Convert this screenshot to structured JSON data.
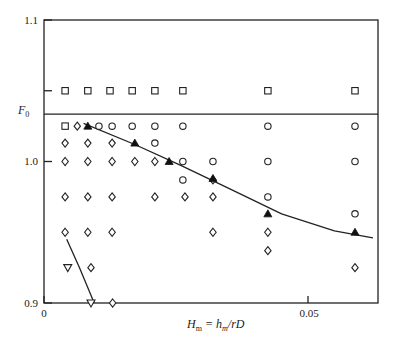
{
  "chart_data": {
    "type": "scatter",
    "title": "",
    "xlabel": "H_m = h_m/rD",
    "ylabel": "F_0",
    "xlim": [
      0,
      0.063
    ],
    "ylim": [
      0.9,
      1.1
    ],
    "x_ticks": [
      {
        "value": 0,
        "label": "0"
      },
      {
        "value": 0.05,
        "label": "0.05"
      }
    ],
    "y_ticks": [
      {
        "value": 0.9,
        "label": "0.9"
      },
      {
        "value": 1.0,
        "label": "1.0"
      },
      {
        "value": 1.1,
        "label": "1.1"
      },
      {
        "value": 1.05,
        "label": ""
      }
    ],
    "grid": false,
    "reference_line": {
      "y": 1.0335,
      "label": "F_0 level"
    },
    "series": [
      {
        "name": "square",
        "marker": "square",
        "points": [
          [
            0.004,
            1.05
          ],
          [
            0.0083,
            1.05
          ],
          [
            0.0125,
            1.05
          ],
          [
            0.0167,
            1.05
          ],
          [
            0.021,
            1.05
          ],
          [
            0.0263,
            1.05
          ],
          [
            0.0424,
            1.05
          ],
          [
            0.0589,
            1.05
          ],
          [
            0.004,
            1.025
          ]
        ]
      },
      {
        "name": "circle",
        "marker": "circle",
        "points": [
          [
            0.0104,
            1.025
          ],
          [
            0.0129,
            1.025
          ],
          [
            0.0167,
            1.025
          ],
          [
            0.021,
            1.025
          ],
          [
            0.0263,
            1.025
          ],
          [
            0.0424,
            1.025
          ],
          [
            0.0589,
            1.025
          ],
          [
            0.021,
            1.013
          ],
          [
            0.0263,
            1.0
          ],
          [
            0.032,
            1.0
          ],
          [
            0.0424,
            1.0
          ],
          [
            0.0589,
            1.0
          ],
          [
            0.0263,
            0.987
          ],
          [
            0.0424,
            0.975
          ],
          [
            0.0589,
            0.963
          ]
        ]
      },
      {
        "name": "diamond",
        "marker": "diamond",
        "points": [
          [
            0.0063,
            1.025
          ],
          [
            0.004,
            1.013
          ],
          [
            0.0083,
            1.013
          ],
          [
            0.0129,
            1.013
          ],
          [
            0.004,
            1.0
          ],
          [
            0.0083,
            1.0
          ],
          [
            0.0129,
            1.0
          ],
          [
            0.0172,
            1.0
          ],
          [
            0.021,
            1.0
          ],
          [
            0.032,
            0.987
          ],
          [
            0.004,
            0.975
          ],
          [
            0.0083,
            0.975
          ],
          [
            0.0129,
            0.975
          ],
          [
            0.021,
            0.975
          ],
          [
            0.0267,
            0.975
          ],
          [
            0.032,
            0.975
          ],
          [
            0.004,
            0.95
          ],
          [
            0.0083,
            0.95
          ],
          [
            0.0129,
            0.95
          ],
          [
            0.032,
            0.95
          ],
          [
            0.0424,
            0.95
          ],
          [
            0.0424,
            0.937
          ],
          [
            0.0089,
            0.925
          ],
          [
            0.0589,
            0.925
          ],
          [
            0.013,
            0.9
          ]
        ]
      },
      {
        "name": "filled-triangle",
        "marker": "triangle-up-filled",
        "points": [
          [
            0.0083,
            1.025
          ],
          [
            0.0172,
            1.013
          ],
          [
            0.0237,
            1.0
          ],
          [
            0.032,
            0.988
          ],
          [
            0.0424,
            0.963
          ],
          [
            0.0589,
            0.95
          ]
        ]
      },
      {
        "name": "open-triangle-down",
        "marker": "triangle-down",
        "points": [
          [
            0.0045,
            0.925
          ],
          [
            0.0089,
            0.9
          ]
        ]
      }
    ],
    "curves": [
      {
        "name": "upper-fit",
        "points": [
          [
            0.0075,
            1.027
          ],
          [
            0.0172,
            1.012
          ],
          [
            0.026,
            0.997
          ],
          [
            0.035,
            0.981
          ],
          [
            0.045,
            0.963
          ],
          [
            0.055,
            0.951
          ],
          [
            0.0623,
            0.946
          ]
        ]
      },
      {
        "name": "lower-fit",
        "points": [
          [
            0.0043,
            0.945
          ],
          [
            0.0067,
            0.925
          ],
          [
            0.0095,
            0.9
          ]
        ]
      }
    ]
  },
  "labels": {
    "y_top": "1.1",
    "y_mid": "1.0",
    "y_bottom": "0.9",
    "y_axis": "F",
    "y_axis_sub": "0",
    "x_zero": "0",
    "x_005": "0.05",
    "x_axis_H": "H",
    "x_axis_sub_m": "m",
    "x_axis_eq": " = h",
    "x_axis_sub_m2": "m",
    "x_axis_tail": "/rD"
  }
}
